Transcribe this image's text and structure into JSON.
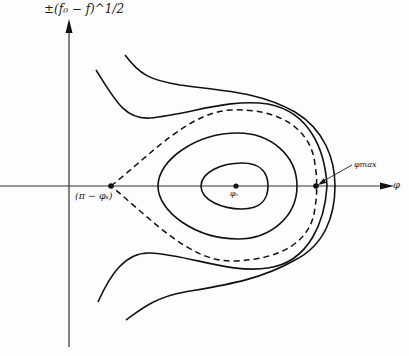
{
  "figure": {
    "type": "phase-space diagram",
    "y_axis_label": "±(f₀ − f)^1/2",
    "x_axis_label": "φ",
    "annotations": {
      "cusp_point": "(π − φₛ)",
      "center_point": "φₛ",
      "max_point": "φmax"
    },
    "curves": {
      "closed_orbits": 3,
      "separatrix": "dashed",
      "open_trajectories": 2
    },
    "colors": {
      "line": "#111111",
      "background": "#fdfdfd"
    }
  }
}
